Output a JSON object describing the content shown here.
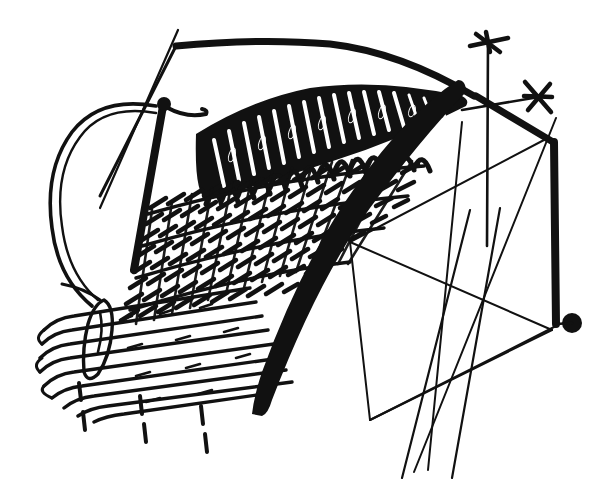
{
  "figure": {
    "title": "Knitting illustration: needle and yarn through ribbed fabric",
    "style": "black-and-white pen-and-ink line art",
    "background_color": "#ffffff",
    "ink_color": "#111111",
    "canvas": {
      "width": 601,
      "height": 488
    },
    "has_text_labels": false,
    "caption": ""
  },
  "elements": {
    "top_edge_rail": {
      "name": "top selvedge rail",
      "description": "thick near-horizontal cast-on edge running across the upper area, bending down at a corner on the left"
    },
    "fabric_body": {
      "name": "knitted fabric body",
      "description": "large fan-shaped panel of dense stitch texture fanning from lower-left to upper-right",
      "texture": "diagonal chain-stitch rows",
      "row_count": 26,
      "stitch_density": "high"
    },
    "dark_stitch_band": {
      "name": "dark scribbled stitch band",
      "description": "heavily inked zig-zag stitching along the upper arc of the fabric converging to a point at the right"
    },
    "arc_edge": {
      "name": "thick curved selvedge arc",
      "description": "bold solid black curved band forming the right/lower boundary of the fabric"
    },
    "needle": {
      "name": "knitting needle",
      "description": "vertical black needle with rounded head passing through the fabric at upper-left",
      "orientation": "vertical"
    },
    "yarn_loop": {
      "name": "yarn loop",
      "description": "open loop of yarn curving around the left side, drawn as a thin double outline"
    },
    "yarn_tail": {
      "name": "yarn tail",
      "description": "short horizontal tapered yarn end leaving the needle head to the right"
    },
    "guide_line": {
      "name": "thin diagonal guide line",
      "description": "fine diagonal line crossing the yarn loop from upper right to lower left"
    },
    "pin_eyelet": {
      "name": "elongated pin / eyelet marker",
      "description": "narrow pointed oval lying across the horizontal cords in the lower-left corner"
    },
    "cord_rows": {
      "name": "smooth cord rows",
      "description": "group of smooth rounded parallel cords at the lower-left with capped ends",
      "count": 9
    },
    "dashed_markers": {
      "name": "dashed stitch guides",
      "description": "three short vertical dashed lines hanging below the fabric edge",
      "count": 3,
      "dash_segments_each": 2
    },
    "wireframe": {
      "name": "geometric wireframe",
      "description": "thin-line quadrilateral and crossing diagonals occupying the right half, suggesting a frame or former",
      "line_weight": "thin"
    },
    "vertical_post": {
      "name": "thick vertical post",
      "description": "bold vertical bar on the far right terminating in a filled round dot at its base"
    },
    "terminal_dot": {
      "name": "terminal round dot",
      "description": "solid filled circle at the foot of the vertical post"
    },
    "cross_markers": {
      "name": "crosshair markers",
      "description": "two small asterisk/cross marks at the free ends of two thin rods at the upper right",
      "count": 2
    },
    "stray_lines": {
      "name": "stray crossing lines",
      "description": "two long thin lines running off the bottom edge of the drawing",
      "count": 2
    }
  }
}
